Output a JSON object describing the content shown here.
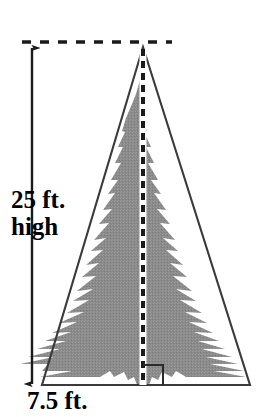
{
  "figure": {
    "kind": "geometry-diagram",
    "background_color": "#ffffff"
  },
  "labels": {
    "height_line1": "25 ft.",
    "height_line2": "high",
    "base": "7.5 ft."
  },
  "measurements": {
    "height_value": "25",
    "height_unit": "ft.",
    "height_qualifier": "high",
    "base_value": "7.5",
    "base_unit": "ft."
  },
  "colors": {
    "tree_fill": "#8a8a8a",
    "tree_fill_light": "#9a9a9a",
    "outline": "#3a3a3a",
    "dash": "#1a1a1a",
    "arrow": "#1a1a1a",
    "halo": "#ffffff",
    "text": "#000000"
  },
  "geometry": {
    "apex": {
      "x": 143,
      "y": 47
    },
    "base_left": {
      "x": 42,
      "y": 385
    },
    "base_right": {
      "x": 250,
      "y": 385
    },
    "altitude_x": 143,
    "top_dashed_line": {
      "x1": 22,
      "x2": 172,
      "y": 42
    },
    "dimension_arrow": {
      "x": 32,
      "y_top": 47,
      "y_bottom": 385
    },
    "right_angle_marker": {
      "x": 143,
      "y": 385,
      "size": 20
    }
  },
  "elements": {
    "triangle_name": "isosceles-triangle-outline",
    "tree_name": "evergreen-tree-silhouette",
    "altitude_name": "altitude-dashed-line",
    "right_angle_name": "right-angle-marker",
    "height_arrow_name": "height-dimension-arrow",
    "top_extension_name": "top-extension-dashed-line"
  }
}
